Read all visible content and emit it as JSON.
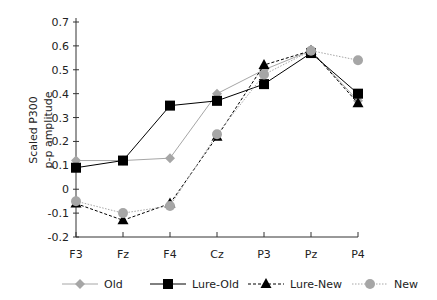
{
  "chart_data": {
    "type": "line",
    "title": "",
    "xlabel": "",
    "ylabel": "Scaled P300 p-p amplitude",
    "ylabel_lines": [
      "Scaled P300",
      "p-p amplitude"
    ],
    "categories": [
      "F3",
      "Fz",
      "F4",
      "Cz",
      "P3",
      "Pz",
      "P4"
    ],
    "yticks": [
      "0.7",
      "0.6",
      "0.5",
      "0.4",
      "0.3",
      "0.2",
      "0.1",
      "0",
      "-0.1",
      "-0.2"
    ],
    "ylim": [
      -0.2,
      0.7
    ],
    "grid": false,
    "legend_position": "bottom",
    "series": [
      {
        "name": "Old",
        "marker": "diamond",
        "color": "#a6a6a6",
        "dash": "solid",
        "values": [
          0.12,
          0.12,
          0.13,
          0.4,
          0.5,
          0.58,
          0.37
        ]
      },
      {
        "name": "Lure-Old",
        "marker": "square",
        "color": "#000000",
        "dash": "solid",
        "values": [
          0.09,
          0.12,
          0.35,
          0.37,
          0.44,
          0.57,
          0.4
        ]
      },
      {
        "name": "Lure-New",
        "marker": "triangle",
        "color": "#000000",
        "dash": "dashed",
        "values": [
          -0.06,
          -0.13,
          -0.06,
          0.22,
          0.52,
          0.58,
          0.36
        ]
      },
      {
        "name": "New",
        "marker": "circle",
        "color": "#a6a6a6",
        "dash": "dotted",
        "values": [
          -0.05,
          -0.1,
          -0.07,
          0.23,
          0.48,
          0.58,
          0.54
        ]
      }
    ]
  }
}
